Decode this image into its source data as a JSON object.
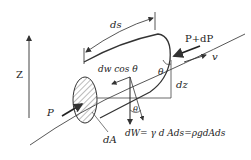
{
  "diagram": {
    "type": "fluid-element-streamtube",
    "labels": {
      "z_axis": "Z",
      "ds": "ds",
      "p_in": "P",
      "p_out": "P+dP",
      "velocity": "v",
      "dw_cos": "dw  cos θ",
      "theta_top": "θ",
      "theta_bottom": "θ",
      "dz": "dz",
      "dA": "dA",
      "weight_eq": "dW= γ d Ads=ρgdAds"
    },
    "colors": {
      "line": "#333333",
      "hatch": "#555555",
      "background": "#ffffff"
    }
  }
}
